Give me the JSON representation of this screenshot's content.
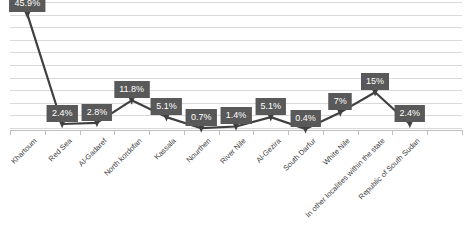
{
  "chart_data": {
    "type": "line",
    "title": "",
    "subtitle": "",
    "xlabel": "",
    "ylabel": "",
    "grid": true,
    "legend_position": "none",
    "ylim": [
      0,
      50
    ],
    "ytick_labels": [],
    "categories": [
      "Khartoum",
      "Red Sea",
      "Al-Gadaref",
      "North kordofan",
      "Kassala",
      "Nourthen",
      "River Nile",
      "Al-Gezira",
      "South Darfur",
      "White Nile",
      "In other localities within the state",
      "Republic of South Sudan"
    ],
    "values": [
      45.9,
      2.4,
      2.8,
      11.8,
      5.1,
      0.7,
      1.4,
      5.1,
      0.4,
      7,
      15,
      2.4
    ],
    "data_labels": [
      "45.9%",
      "2.4%",
      "2.8%",
      "11.8%",
      "5.1%",
      "0.7%",
      "1.4%",
      "5.1%",
      "0.4%",
      "7%",
      "15%",
      "2.4%"
    ],
    "series": [
      {
        "name": "Series 1",
        "values": [
          45.9,
          2.4,
          2.8,
          11.8,
          5.1,
          0.7,
          1.4,
          5.1,
          0.4,
          7,
          15,
          2.4
        ]
      }
    ],
    "colors": {
      "line": "#404040",
      "marker": "#404040",
      "label_background": "#595959",
      "label_text": "#ffffff",
      "gridline": "#d9d9d9",
      "axis": "#bfbfbf",
      "plot_background": "#ffffff"
    },
    "gridline_count": 11
  }
}
